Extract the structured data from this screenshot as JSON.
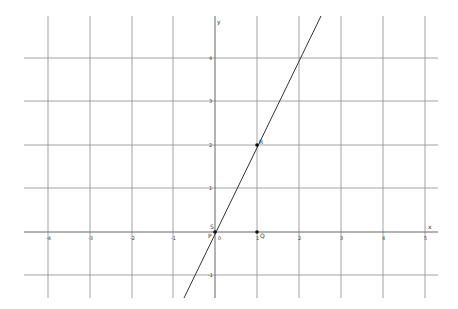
{
  "graph": {
    "x_axis_label": "x",
    "y_axis_label": "y",
    "x_ticks": [
      "-4",
      "-3",
      "-2",
      "-1",
      "0",
      "1",
      "2",
      "3",
      "4",
      "5"
    ],
    "y_ticks": [
      "4",
      "3",
      "2",
      "1",
      "-1"
    ],
    "origin_label": "0",
    "line": {
      "equation": "y = 2x",
      "through": [
        [
          0,
          0
        ],
        [
          1,
          2
        ]
      ]
    },
    "points": [
      {
        "label": "S",
        "x": 0,
        "y": 0
      },
      {
        "label": "P",
        "x": 0,
        "y": 0
      },
      {
        "label": "R",
        "x": 1,
        "y": 2
      },
      {
        "label": "Q",
        "x": 1,
        "y": 0
      }
    ],
    "colors": {
      "grid": "#8c8c8c",
      "line": "#333333",
      "point": "#111111"
    }
  }
}
